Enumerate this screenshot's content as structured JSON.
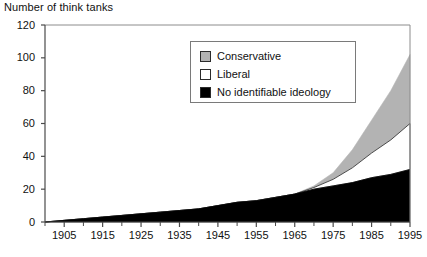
{
  "chart_data": {
    "type": "area",
    "title": "Number of think tanks",
    "xlabel": "",
    "ylabel": "Number of think tanks",
    "stacked": true,
    "grid": false,
    "legend_position": "upper-center",
    "xlim": [
      1900,
      1995
    ],
    "ylim": [
      0,
      120
    ],
    "ytick_values": [
      0,
      20,
      40,
      60,
      80,
      100,
      120
    ],
    "ytick_labels": [
      "0",
      "20",
      "40",
      "60",
      "80",
      "100",
      "120"
    ],
    "xtick_labels": [
      "1905",
      "1915",
      "1925",
      "1935",
      "1945",
      "1955",
      "1965",
      "1975",
      "1985",
      "1995"
    ],
    "xtick_values": [
      1905,
      1915,
      1925,
      1935,
      1945,
      1955,
      1965,
      1975,
      1985,
      1995
    ],
    "xtick_minor_values": [
      1900,
      1910,
      1920,
      1930,
      1940,
      1950,
      1960,
      1970,
      1980,
      1990
    ],
    "x": [
      1900,
      1905,
      1910,
      1915,
      1920,
      1925,
      1930,
      1935,
      1940,
      1945,
      1950,
      1955,
      1960,
      1965,
      1970,
      1975,
      1980,
      1985,
      1990,
      1995
    ],
    "series": [
      {
        "name": "No identifiable ideology",
        "color": "#000000",
        "values": [
          0,
          1,
          2,
          3,
          4,
          5,
          6,
          7,
          8,
          10,
          12,
          13,
          15,
          17,
          20,
          22,
          24,
          27,
          29,
          32
        ]
      },
      {
        "name": "Liberal",
        "color": "#ffffff",
        "values": [
          0,
          0,
          0,
          0,
          0,
          0,
          0,
          0,
          0,
          0,
          0,
          0,
          0,
          0,
          1,
          4,
          9,
          15,
          21,
          28
        ]
      },
      {
        "name": "Conservative",
        "color": "#b3b3b3",
        "values": [
          0,
          0,
          0,
          0,
          0,
          0,
          0,
          0,
          0,
          0,
          0,
          0,
          0,
          0,
          1,
          4,
          11,
          20,
          30,
          42
        ]
      }
    ],
    "series_totals_note": "",
    "stack_tops": {
      "1970": [
        20,
        21,
        22
      ],
      "1975": [
        22,
        26,
        30
      ],
      "1980": [
        24,
        33,
        44
      ],
      "1985": [
        27,
        42,
        62
      ],
      "1990": [
        29,
        50,
        80
      ],
      "1995": [
        32,
        60,
        102
      ]
    }
  },
  "legend": {
    "items": [
      {
        "label": "Conservative",
        "color": "#b3b3b3"
      },
      {
        "label": "Liberal",
        "color": "#ffffff"
      },
      {
        "label": "No identifiable ideology",
        "color": "#000000"
      }
    ]
  },
  "axis": {
    "line_color": "#8c8c8c"
  }
}
